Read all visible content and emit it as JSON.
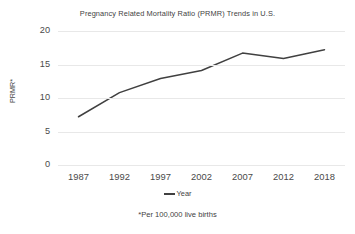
{
  "chart_data": {
    "type": "line",
    "title": "Pregnancy Related Mortality Ratio (PRMR) Trends in U.S.",
    "xlabel": "",
    "ylabel": "PRMR*",
    "categories": [
      "1987",
      "1992",
      "1997",
      "2002",
      "2007",
      "2012",
      "2018"
    ],
    "values": [
      7.2,
      10.8,
      12.9,
      14.1,
      16.7,
      15.9,
      17.2
    ],
    "series": [
      {
        "name": "Year",
        "values": [
          7.2,
          10.8,
          12.9,
          14.1,
          16.7,
          15.9,
          17.2
        ]
      }
    ],
    "ylim": [
      0,
      20
    ],
    "yticks": [
      0,
      5,
      10,
      15,
      20
    ],
    "ytick_labels": [
      "0",
      "5",
      "10",
      "15",
      "20"
    ],
    "grid": true,
    "legend_position": "bottom",
    "legend_entries": [
      "Year"
    ],
    "annotations": [
      "*Per 100,000 live births"
    ],
    "line_color": "#404040",
    "grid_color": "#e8e8e8",
    "text_color": "#3f3f3f"
  },
  "footnote": "*Per 100,000 live births",
  "legend": {
    "label": "Year"
  }
}
